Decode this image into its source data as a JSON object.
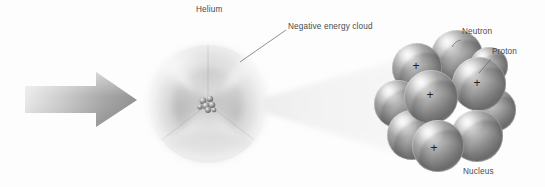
{
  "figure": {
    "background_color": "#fdfdfd",
    "width": 545,
    "height": 187
  },
  "labels": {
    "helium": "Helium",
    "negative_energy_cloud": "Negative energy cloud",
    "neutron": "Neutron",
    "proton": "Proton",
    "nucleus": "Nucleus"
  },
  "charge_symbols": {
    "proton_charge": "+"
  },
  "colors": {
    "arrow_light": "#d8d8d8",
    "arrow_dark": "#8f8f8f",
    "cloud_outer": "#e6e6e6",
    "cloud_inner": "#bdbdbd",
    "sphere_light": "#e2e2e2",
    "sphere_mid": "#9b9b9b",
    "sphere_dark": "#5d5d5d",
    "leader_line": "#6b6b6b",
    "text": "#4a4a4a",
    "cone": "#efefef"
  },
  "diagram": {
    "incoming_arrow": {
      "name": "incoming-beam-arrow",
      "direction": "right",
      "shaft_left_x": 25,
      "tip_x": 137,
      "center_y": 100
    },
    "atom": {
      "name": "helium-atom-cloud",
      "center_x": 208,
      "center_y": 104,
      "radius": 58,
      "cutaway_wedges": 3
    },
    "magnifier_cone": {
      "name": "magnification-cone",
      "apex_x": 266,
      "apex_y": 105,
      "base_x": 400,
      "base_top_y": 60,
      "base_bottom_y": 154
    },
    "nucleus_cluster": {
      "name": "magnified-nucleus",
      "center_x": 455,
      "center_y": 100,
      "particle_count": 10,
      "particles": [
        {
          "id": "p1",
          "type": "proton",
          "cx": 417,
          "cy": 68,
          "r": 25,
          "charge": "+",
          "charge_x": 416,
          "charge_y": 66,
          "depth": 2
        },
        {
          "id": "n1",
          "type": "neutron",
          "cx": 457,
          "cy": 56,
          "r": 26,
          "charge": "",
          "depth": 1
        },
        {
          "id": "p2",
          "type": "proton",
          "cx": 479,
          "cy": 84,
          "r": 27,
          "charge": "+",
          "charge_x": 477,
          "charge_y": 83,
          "depth": 4
        },
        {
          "id": "p3",
          "type": "proton",
          "cx": 431,
          "cy": 97,
          "r": 27,
          "charge": "+",
          "charge_x": 430,
          "charge_y": 95,
          "depth": 5
        },
        {
          "id": "n2",
          "type": "neutron",
          "cx": 398,
          "cy": 104,
          "r": 24,
          "charge": "",
          "depth": 2
        },
        {
          "id": "n3",
          "type": "neutron",
          "cx": 412,
          "cy": 135,
          "r": 25,
          "charge": "",
          "depth": 3
        },
        {
          "id": "p4",
          "type": "proton",
          "cx": 438,
          "cy": 146,
          "r": 26,
          "charge": "+",
          "charge_x": 434,
          "charge_y": 148,
          "depth": 6
        },
        {
          "id": "n4",
          "type": "neutron",
          "cx": 477,
          "cy": 136,
          "r": 26,
          "charge": "",
          "depth": 5
        },
        {
          "id": "n5",
          "type": "neutron",
          "cx": 494,
          "cy": 110,
          "r": 22,
          "charge": "",
          "depth": 3
        },
        {
          "id": "n6",
          "type": "neutron",
          "cx": 489,
          "cy": 66,
          "r": 19,
          "charge": "",
          "depth": 1
        }
      ]
    },
    "leader_lines": [
      {
        "name": "cloud-leader-line",
        "x1": 240,
        "y1": 62,
        "x2": 286,
        "y2": 30
      },
      {
        "name": "neutron-leader-line",
        "x1": 462,
        "y1": 40,
        "x2": 452,
        "y2": 48
      },
      {
        "name": "proton-leader-line",
        "x1": 492,
        "y1": 59,
        "x2": 480,
        "y2": 72
      }
    ],
    "center_nucleus_dot": {
      "name": "atom-center-nucleus",
      "cx": 208,
      "cy": 105,
      "r": 8
    }
  }
}
